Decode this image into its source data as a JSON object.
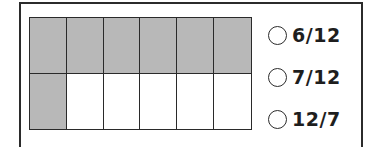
{
  "question": {
    "grid": {
      "rows": 2,
      "columns": 6,
      "shaded_count": 7,
      "total_count": 12,
      "shaded_color": "#b8b8b8",
      "unshaded_color": "#ffffff",
      "cells": [
        {
          "row": 0,
          "col": 0,
          "shaded": true
        },
        {
          "row": 0,
          "col": 1,
          "shaded": true
        },
        {
          "row": 0,
          "col": 2,
          "shaded": true
        },
        {
          "row": 0,
          "col": 3,
          "shaded": true
        },
        {
          "row": 0,
          "col": 4,
          "shaded": true
        },
        {
          "row": 0,
          "col": 5,
          "shaded": true
        },
        {
          "row": 1,
          "col": 0,
          "shaded": true
        },
        {
          "row": 1,
          "col": 1,
          "shaded": false
        },
        {
          "row": 1,
          "col": 2,
          "shaded": false
        },
        {
          "row": 1,
          "col": 3,
          "shaded": false
        },
        {
          "row": 1,
          "col": 4,
          "shaded": false
        },
        {
          "row": 1,
          "col": 5,
          "shaded": false
        }
      ]
    },
    "options": [
      {
        "label": "6/12",
        "selected": false
      },
      {
        "label": "7/12",
        "selected": false
      },
      {
        "label": "12/7",
        "selected": false
      }
    ]
  }
}
